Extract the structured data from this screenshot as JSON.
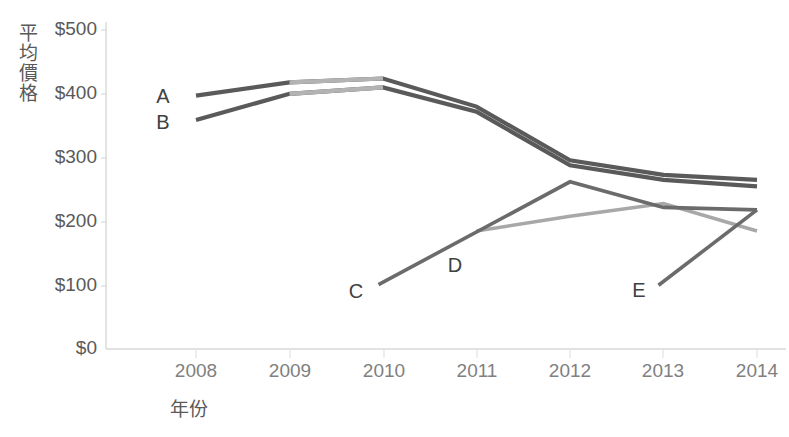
{
  "chart_data": {
    "type": "line",
    "title": "",
    "xlabel": "年份",
    "ylabel": "平均價格",
    "categories": [
      "2008",
      "2009",
      "2010",
      "2011",
      "2012",
      "2013",
      "2014"
    ],
    "ylim": [
      0,
      500
    ],
    "ytick_values": [
      0,
      100,
      200,
      300,
      400,
      500
    ],
    "ytick_labels": [
      "$0",
      "$100",
      "$200",
      "$300",
      "$400",
      "$500"
    ],
    "grid": false,
    "legend": "inline-labels",
    "series": [
      {
        "name": "A",
        "label": "A",
        "color": "#5a5a5a",
        "x": [
          "2008",
          "2009",
          "2010",
          "2011",
          "2012",
          "2013",
          "2014"
        ],
        "values": [
          397,
          418,
          424,
          380,
          296,
          273,
          265
        ]
      },
      {
        "name": "B",
        "label": "B",
        "color": "#5a5a5a",
        "x": [
          "2008",
          "2009",
          "2010",
          "2011",
          "2012",
          "2013",
          "2014"
        ],
        "values": [
          359,
          400,
          410,
          372,
          288,
          265,
          255
        ]
      },
      {
        "name": "C",
        "label": "C",
        "color": "#6b6b6b",
        "x": [
          "2011",
          "2012",
          "2013",
          "2014"
        ],
        "values": [
          101,
          262,
          222,
          218
        ],
        "note": "starts at 2011 near $100 on left of 2011 tick, peaks 2012"
      },
      {
        "name": "D",
        "label": "D",
        "color": "#a8a8a8",
        "x": [
          "2011",
          "2012",
          "2013",
          "2014"
        ],
        "values": [
          185,
          208,
          228,
          185
        ]
      },
      {
        "name": "E",
        "label": "E",
        "color": "#6b6b6b",
        "x": [
          "2013",
          "2014"
        ],
        "values": [
          100,
          218
        ]
      }
    ],
    "series_labels": [
      {
        "text": "A",
        "series": "A"
      },
      {
        "text": "B",
        "series": "B"
      },
      {
        "text": "C",
        "series": "C"
      },
      {
        "text": "D",
        "series": "D"
      },
      {
        "text": "E",
        "series": "E"
      }
    ]
  },
  "axis": {
    "y_title_chars": [
      "平",
      "均",
      "價",
      "格"
    ],
    "x_title": "年份"
  },
  "colors": {
    "axis_line": "#d9d9d9",
    "tick_text": "#595959",
    "dark_series": "#5a5a5a",
    "mid_series": "#6b6b6b",
    "light_series": "#a8a8a8",
    "background": "#ffffff"
  }
}
